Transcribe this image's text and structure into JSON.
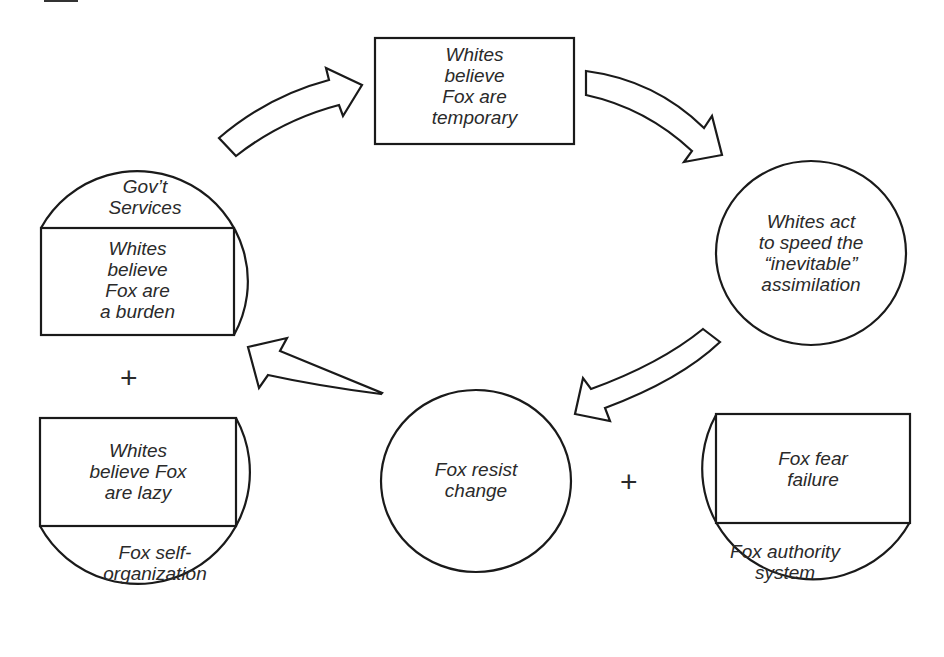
{
  "diagram": {
    "nodes": {
      "top_box": {
        "text": "Whites\nbelieve\nFox are\ntemporary"
      },
      "right_circle": {
        "text": "Whites act\nto speed the\n“inevitable”\nassimilation"
      },
      "left_circle": {
        "header": "Gov’t\nServices",
        "box_text": "Whites\nbelieve\nFox are\na burden"
      },
      "bottom_left": {
        "box_text": "Whites\nbelieve Fox\nare lazy",
        "footer": "Fox self-\norganization"
      },
      "center_circle": {
        "text": "Fox resist\nchange"
      },
      "bottom_right": {
        "box_text": "Fox fear\nfailure",
        "footer": "Fox authority\nsystem"
      }
    },
    "operators": {
      "left_plus": "+",
      "right_plus": "+"
    },
    "arrows": [
      {
        "from": "left_circle",
        "to": "top_box"
      },
      {
        "from": "top_box",
        "to": "right_circle"
      },
      {
        "from": "right_circle",
        "to": "center_circle"
      },
      {
        "from": "center_circle",
        "to": "left_circle"
      }
    ],
    "colors": {
      "stroke": "#1a1a1a",
      "fill": "#ffffff",
      "text": "#2a2a2a"
    }
  }
}
